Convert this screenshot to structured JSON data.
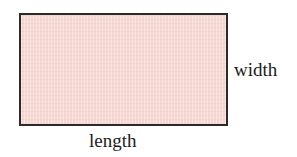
{
  "figure": {
    "type": "geometry-diagram",
    "shape": "rectangle",
    "background_color": "#ffffff",
    "rectangle": {
      "fill_color": "#f6d6d1",
      "border_color": "#2b2a29",
      "border_width_px": 2,
      "x": 19,
      "y": 13,
      "width_px": 209,
      "height_px": 113
    },
    "labels": {
      "width": "width",
      "length": "length"
    }
  }
}
